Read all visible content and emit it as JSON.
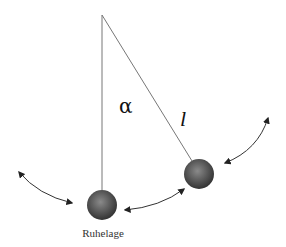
{
  "diagram": {
    "type": "pendulum",
    "labels": {
      "angle": "α",
      "length": "l",
      "rest_position": "Ruhelage"
    },
    "pivot": {
      "x": 102,
      "y": 15
    },
    "bobs": [
      {
        "name": "bob-rest",
        "cx": 102,
        "cy": 205,
        "r": 15
      },
      {
        "name": "bob-deflected",
        "cx": 199,
        "cy": 174,
        "r": 15
      }
    ],
    "colors": {
      "string": "#777777",
      "bob_light": "#8a8a8a",
      "bob_dark": "#3a3a3a",
      "arrow": "#222222",
      "text": "#111111"
    }
  }
}
